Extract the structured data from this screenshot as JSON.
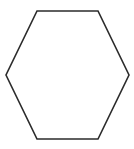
{
  "figure": {
    "name": "hexagon",
    "title": "Regular hexagon outline",
    "canvas": {
      "width": 134,
      "height": 149,
      "background_color": "#ffffff"
    },
    "shape": {
      "kind": "polygon",
      "sides": 6,
      "label": "hexagon",
      "orientation": "pointy-left-right",
      "fill_color": "#ffffff",
      "filled": false,
      "stroke_color": "#2b2b2b",
      "stroke_width": 1.6,
      "vertices": [
        {
          "name": "top-left",
          "x": 37,
          "y": 11
        },
        {
          "name": "top-right",
          "x": 98,
          "y": 11
        },
        {
          "name": "right",
          "x": 129,
          "y": 75
        },
        {
          "name": "bottom-right",
          "x": 98,
          "y": 139
        },
        {
          "name": "bottom-left",
          "x": 37,
          "y": 139
        },
        {
          "name": "left",
          "x": 6,
          "y": 75
        }
      ],
      "points_attr": "37,11 98,11 129,75 98,139 37,139 6,75",
      "bounding_box": {
        "x": 6,
        "y": 11,
        "width": 123,
        "height": 128
      },
      "center": {
        "x": 67.5,
        "y": 75
      }
    }
  }
}
